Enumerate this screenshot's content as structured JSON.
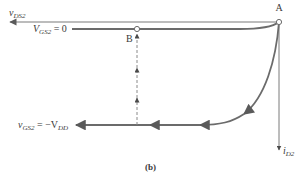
{
  "diagram": {
    "caption": "(b)",
    "axes": {
      "x_axis": {
        "symbol": "v",
        "subscript": "DS2",
        "direction": "left"
      },
      "y_axis": {
        "symbol": "i",
        "subscript": "D2",
        "direction": "down"
      }
    },
    "points": [
      {
        "id": "A",
        "label": "A"
      },
      {
        "id": "B",
        "label": "B"
      }
    ],
    "curves": [
      {
        "id": "vgs0",
        "label_main": "V",
        "label_sub": "GS2",
        "label_rest": " = 0"
      },
      {
        "id": "vgs_neg_vdd",
        "label_main": "v",
        "label_sub": "GS2",
        "label_rest": " = −V",
        "label_sub2": "DD"
      }
    ],
    "colors": {
      "line": "#6b6b6b",
      "arrow": "#5a5a5a",
      "dashed": "#8a8a8a",
      "text": "#3a3a3a"
    }
  }
}
